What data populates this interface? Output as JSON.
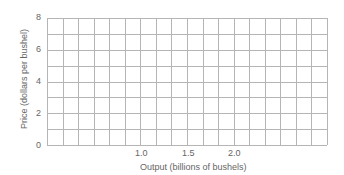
{
  "chart_data": {
    "type": "line",
    "title": "",
    "xlabel": "Output (billions of bushels)",
    "ylabel": "Price (dollars per bushel)",
    "ylim": [
      0,
      8
    ],
    "yticks": [
      "0",
      "2",
      "4",
      "6",
      "8"
    ],
    "xticks": [
      "1.0",
      "1.5",
      "2.0"
    ],
    "grid": true,
    "grid_columns": 18,
    "grid_rows": 8,
    "series": []
  }
}
